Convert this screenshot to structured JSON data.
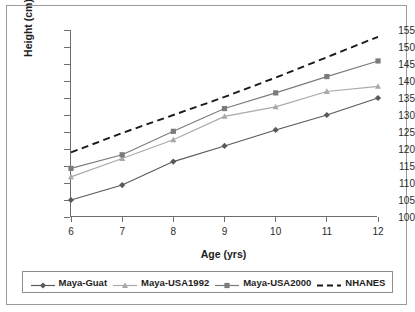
{
  "chart_data": {
    "type": "line",
    "title": "",
    "xlabel": "Age (yrs)",
    "ylabel": "Height (cm)",
    "x": [
      6,
      7,
      8,
      9,
      10,
      11,
      12
    ],
    "xtick_labels": [
      "6",
      "7",
      "8",
      "9",
      "10",
      "11",
      "12"
    ],
    "ytick_labels": [
      "100",
      "105",
      "110",
      "115",
      "120",
      "125",
      "130",
      "135",
      "140",
      "145",
      "150",
      "155"
    ],
    "yticks": [
      100,
      105,
      110,
      115,
      120,
      125,
      130,
      135,
      140,
      145,
      150,
      155
    ],
    "xlim": [
      6,
      12
    ],
    "ylim": [
      100,
      155
    ],
    "grid": false,
    "legend_position": "bottom",
    "series": [
      {
        "name": "Maya-Guat",
        "marker": "diamond",
        "line_style": "solid",
        "color": "#595959",
        "values": [
          105.0,
          109.4,
          116.3,
          120.9,
          125.6,
          130.0,
          135.0
        ]
      },
      {
        "name": "Maya-USA1992",
        "marker": "triangle",
        "line_style": "solid",
        "color": "#a9a9a9",
        "values": [
          111.8,
          117.2,
          122.7,
          129.6,
          132.4,
          136.9,
          138.4
        ]
      },
      {
        "name": "Maya-USA2000",
        "marker": "square",
        "line_style": "solid",
        "color": "#7b7b7b",
        "values": [
          114.3,
          118.3,
          125.2,
          131.9,
          136.5,
          141.3,
          145.9
        ]
      },
      {
        "name": "NHANES",
        "marker": "none",
        "line_style": "dashed",
        "color": "#1a1a1a",
        "values": [
          119.0,
          124.7,
          130.0,
          135.3,
          141.0,
          147.0,
          153.0
        ]
      }
    ]
  },
  "legend": {
    "items": [
      {
        "label": "Maya-Guat"
      },
      {
        "label": "Maya-USA1992"
      },
      {
        "label": "Maya-USA2000"
      },
      {
        "label": "NHANES"
      }
    ]
  }
}
